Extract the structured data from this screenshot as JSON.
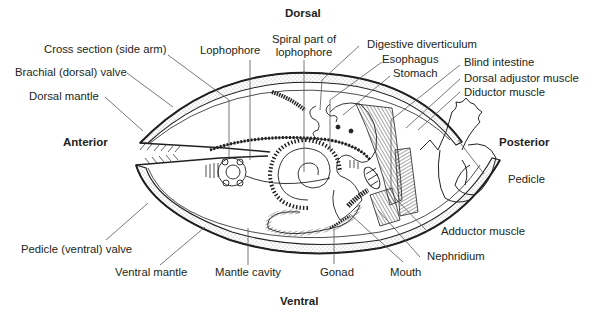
{
  "diagram": {
    "orientation": {
      "dorsal": "Dorsal",
      "ventral": "Ventral",
      "anterior": "Anterior",
      "posterior": "Posterior"
    },
    "labels": {
      "cross_section": "Cross section (side arm)",
      "brachial_valve": "Brachial (dorsal) valve",
      "dorsal_mantle": "Dorsal mantle",
      "lophophore": "Lophophore",
      "spiral_part_line1": "Spiral part of",
      "spiral_part_line2": "lophophore",
      "digestive_diverticulum": "Digestive diverticulum",
      "esophagus": "Esophagus",
      "stomach": "Stomach",
      "blind_intestine": "Blind intestine",
      "dorsal_adjustor": "Dorsal adjustor muscle",
      "diductor": "Diductor muscle",
      "pedicle": "Pedicle",
      "adductor": "Adductor muscle",
      "nephridium": "Nephridium",
      "mouth": "Mouth",
      "gonad": "Gonad",
      "mantle_cavity": "Mantle cavity",
      "ventral_mantle": "Ventral mantle",
      "pedicle_valve": "Pedicle (ventral) valve"
    },
    "colors": {
      "ink": "#231f20",
      "leader": "#555555",
      "background": "#ffffff"
    }
  }
}
